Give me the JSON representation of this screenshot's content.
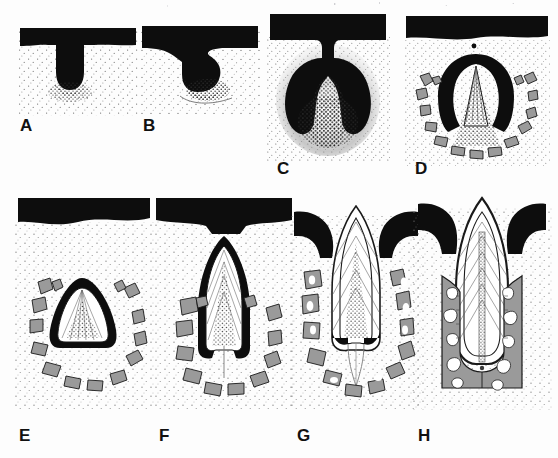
{
  "figure": {
    "panel_count": 8,
    "background_color": "#fdfdfd",
    "ink_color": "#111111",
    "bone_color": "#9a9a9a",
    "bone_outline_color": "#1a1a1a",
    "enamel_color": "#0d0d0d",
    "dentin_color": "#ffffff",
    "pulp_stipple_color": "#2b2b2b",
    "mesenchyme_stipple_color": "#6f6f6f"
  },
  "panels": [
    {
      "label": "A",
      "stage_name": "Bud stage",
      "description": "Oral epithelium thickens and a solid epithelial bud grows down into the underlying ectomesenchyme.",
      "features": [
        "oral epithelium",
        "dental lamina",
        "tooth bud",
        "condensed ectomesenchyme"
      ],
      "has_bone": false,
      "has_enamel_organ": true,
      "has_dentin": false,
      "has_pulp": false,
      "has_crown": false,
      "has_root": false
    },
    {
      "label": "B",
      "stage_name": "Cap stage",
      "description": "The epithelial bud invaginates to form a cap over a condensing dental papilla.",
      "features": [
        "oral epithelium",
        "dental lamina",
        "enamel organ cap",
        "dental papilla"
      ],
      "has_bone": false,
      "has_enamel_organ": true,
      "has_dentin": false,
      "has_pulp": true,
      "has_crown": false,
      "has_root": false
    },
    {
      "label": "C",
      "stage_name": "Bell stage",
      "description": "The enamel organ deepens into a bell enclosing the dental papilla; dental follicle surrounds the germ.",
      "features": [
        "oral epithelium",
        "dental lamina",
        "enamel organ bell",
        "dental papilla",
        "dental follicle"
      ],
      "has_bone": false,
      "has_enamel_organ": true,
      "has_dentin": false,
      "has_pulp": true,
      "has_crown": false,
      "has_root": false
    },
    {
      "label": "D",
      "stage_name": "Appositional stage / early crown formation",
      "description": "Enamel and dentin begin to be deposited at the cusp tip; alveolar bone forms a crypt around the tooth germ.",
      "features": [
        "enamel organ",
        "early enamel matrix",
        "dentin",
        "dental papilla",
        "alveolar bone crypt"
      ],
      "has_bone": true,
      "has_enamel_organ": true,
      "has_dentin": true,
      "has_pulp": true,
      "has_crown": true,
      "has_root": false
    },
    {
      "label": "E",
      "stage_name": "Crown formation",
      "description": "Mineralised crown of enamel over dentin is largely formed within the bony crypt; pulp chamber is wide.",
      "features": [
        "enamel",
        "dentin",
        "pulp",
        "alveolar bone crypt",
        "dental follicle"
      ],
      "has_bone": true,
      "has_enamel_organ": false,
      "has_dentin": true,
      "has_pulp": true,
      "has_crown": true,
      "has_root": false
    },
    {
      "label": "F",
      "stage_name": "Crown completion / root initiation",
      "description": "Crown is complete and elongating toward the oral epithelium; root formation begins at the cervical loop.",
      "features": [
        "oral epithelium",
        "enamel",
        "dentin",
        "pulp",
        "alveolar bone",
        "beginning root"
      ],
      "has_bone": true,
      "has_enamel_organ": false,
      "has_dentin": true,
      "has_pulp": true,
      "has_crown": true,
      "has_root": true
    },
    {
      "label": "G",
      "stage_name": "Eruption",
      "description": "The crown penetrates the oral epithelium and erupts; the root is about half formed with a wide open apex.",
      "features": [
        "erupting crown",
        "gingiva",
        "enamel",
        "dentin",
        "pulp",
        "forming root",
        "open apex",
        "alveolar bone"
      ],
      "has_bone": true,
      "has_enamel_organ": false,
      "has_dentin": true,
      "has_pulp": true,
      "has_crown": true,
      "has_root": true
    },
    {
      "label": "H",
      "stage_name": "Functional tooth / root completion",
      "description": "Fully erupted tooth in occlusion; root is complete with a narrow apical foramen and supporting alveolar bone.",
      "features": [
        "erupted crown",
        "gingiva",
        "enamel",
        "dentin",
        "narrow pulp canal",
        "completed root",
        "apical foramen",
        "alveolar bone",
        "periodontal ligament"
      ],
      "has_bone": true,
      "has_enamel_organ": false,
      "has_dentin": true,
      "has_pulp": true,
      "has_crown": true,
      "has_root": true
    }
  ]
}
